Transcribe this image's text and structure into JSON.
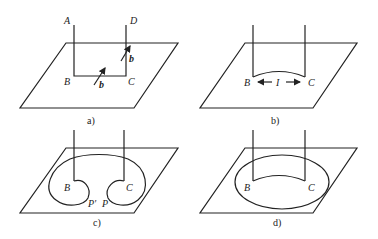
{
  "panels": {
    "a": {
      "caption": "a)",
      "labels": {
        "A": "A",
        "D": "D",
        "B": "B",
        "C": "C",
        "b1": "b",
        "b2": "b"
      }
    },
    "b": {
      "caption": "b)",
      "labels": {
        "B": "B",
        "I": "I",
        "C": "C"
      }
    },
    "c": {
      "caption": "c)",
      "labels": {
        "B": "B",
        "C": "C",
        "Pprime": "P′",
        "P": "P"
      }
    },
    "d": {
      "caption": "d)",
      "labels": {
        "B": "B",
        "C": "C"
      }
    }
  }
}
